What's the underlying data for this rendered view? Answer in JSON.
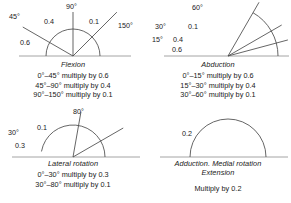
{
  "figure": {
    "kind": "movement-correction-factor-diagrams",
    "stroke_color": "#4a4a4a",
    "text_color": "#1a1a1a",
    "baseline_color": "#9a9a9a"
  },
  "panels": [
    {
      "id": "flexion",
      "title": "Flexion",
      "vertex": {
        "x": 73,
        "y": 56
      },
      "baseline": {
        "x1": 19,
        "x2": 131,
        "y": 56
      },
      "arc": {
        "radius": 27,
        "start_deg": 0,
        "end_deg": 180
      },
      "rays": [
        {
          "angle_deg": 45,
          "length": 62,
          "label": "45°",
          "label_x": 9,
          "label_y": 19
        },
        {
          "angle_deg": 90,
          "length": 44,
          "label": "90°",
          "label_x": 66,
          "label_y": 9
        },
        {
          "angle_deg": 150,
          "length": 58,
          "label": "150°",
          "label_x": 118,
          "label_y": 28
        }
      ],
      "factors": [
        {
          "value": "0.6",
          "x": 20,
          "y": 45
        },
        {
          "value": "0.4",
          "x": 44,
          "y": 24
        },
        {
          "value": "0.1",
          "x": 89,
          "y": 24
        }
      ],
      "rules": [
        "0°–45° multiply by 0.6",
        "45°–90° multiply by 0.4",
        "90°–150° multiply by 0.1"
      ]
    },
    {
      "id": "abduction",
      "title": "Abduction",
      "vertex": {
        "x": 228,
        "y": 56
      },
      "baseline": {
        "x1": 164,
        "x2": 289,
        "y": 56
      },
      "arc": {
        "radius": 50,
        "start_deg": 0,
        "end_deg": 60
      },
      "rays": [
        {
          "angle_deg": 15,
          "length": 62,
          "label": "15°",
          "label_x": 152,
          "label_y": 42
        },
        {
          "angle_deg": 30,
          "length": 62,
          "label": "30°",
          "label_x": 155,
          "label_y": 29
        },
        {
          "angle_deg": 60,
          "length": 62,
          "label": "60°",
          "label_x": 192,
          "label_y": 10
        }
      ],
      "factors": [
        {
          "value": "0.6",
          "x": 172,
          "y": 52
        },
        {
          "value": "0.4",
          "x": 173,
          "y": 42
        },
        {
          "value": "0.1",
          "x": 188,
          "y": 29
        }
      ],
      "rules": [
        "0°–15° multiply by 0.6",
        "15°–30° multiply by 0.4",
        "30°–60° multiply by 0.1"
      ]
    },
    {
      "id": "lateral-rotation",
      "title": "Lateral rotation",
      "vertex": {
        "x": 73,
        "y": 157
      },
      "baseline": {
        "x1": 12,
        "x2": 140,
        "y": 157
      },
      "arc": {
        "radius": 32,
        "start_deg": 0,
        "end_deg": 170
      },
      "rays": [
        {
          "angle_deg": 30,
          "length": 58,
          "label": "30°",
          "label_x": 8,
          "label_y": 135
        },
        {
          "angle_deg": 80,
          "length": 46,
          "label": "80°",
          "label_x": 73,
          "label_y": 114
        }
      ],
      "factors": [
        {
          "value": "0.3",
          "x": 15,
          "y": 148
        },
        {
          "value": "0.1",
          "x": 37,
          "y": 130
        }
      ],
      "rules": [
        "0°–30° multiply by 0.3",
        "30°–80° multiply by 0.1"
      ]
    },
    {
      "id": "adduction",
      "title": "Adduction. Medial rotation",
      "title_line2": "Extension",
      "vertex": {
        "x": 228,
        "y": 157
      },
      "baseline": {
        "x1": 160,
        "x2": 288,
        "y": 157
      },
      "arc": {
        "radius": 38,
        "start_deg": 0,
        "end_deg": 180
      },
      "rays": [],
      "factors": [
        {
          "value": "0.2",
          "x": 182,
          "y": 136
        }
      ],
      "rules": [
        "Multiply by 0.2"
      ]
    }
  ]
}
